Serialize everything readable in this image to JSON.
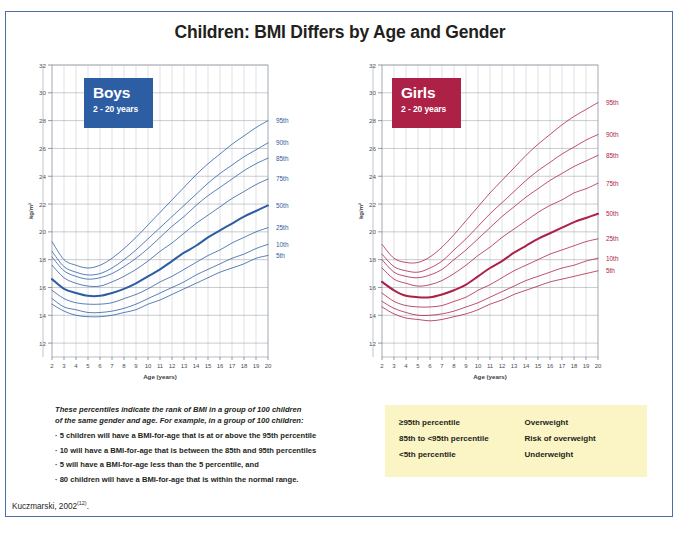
{
  "title": "Children: BMI Differs by Age and Gender",
  "citation": {
    "text": "Kuczmarski, 2002",
    "ref": "(12)",
    "suffix": "."
  },
  "colors": {
    "boys": "#2d5da3",
    "girls": "#ad2147",
    "frame": "#4a6fa8",
    "legend_bg": "#fbf4c4"
  },
  "panels": [
    {
      "key": "boys",
      "badge_name": "Boys",
      "badge_sub": "2 - 20 years",
      "color": "#2d5da3",
      "label_side": "right"
    },
    {
      "key": "girls",
      "badge_name": "Girls",
      "badge_sub": "2 - 20 years",
      "color": "#ad2147",
      "label_side": "right"
    }
  ],
  "notes": {
    "intro_line1": "These percentiles indicate the rank of BMI in a group of 100 children",
    "intro_line2": "of the same gender and age.  For example, in a group of 100 children:",
    "bullets": [
      "· 5 children will have a BMI-for-age that is at or above the 95th percentile",
      "· 10 will have a BMI-for-age that is between the 85th and 95th percentiles",
      "· 5 will have a BMI-for-age less than the 5 percentile, and",
      "· 80 children will have a BMI-for-age that is within the normal range."
    ]
  },
  "legend": {
    "rows": [
      {
        "range": "≥95th percentile",
        "label": "Overweight"
      },
      {
        "range": "85th to <95th percentile",
        "label": "Risk of overweight"
      },
      {
        "range": "<5th percentile",
        "label": "Underweight"
      }
    ]
  },
  "chart_data": [
    {
      "type": "line",
      "title": "Boys",
      "subtitle": "2 - 20 years",
      "xlabel": "Age (years)",
      "ylabel": "kg/m²",
      "xlim": [
        2,
        20
      ],
      "ylim": [
        11,
        32
      ],
      "xticks": [
        2,
        3,
        4,
        5,
        6,
        7,
        8,
        9,
        10,
        11,
        12,
        13,
        14,
        15,
        16,
        17,
        18,
        19,
        20
      ],
      "yticks": [
        12,
        14,
        16,
        18,
        20,
        22,
        24,
        26,
        28,
        30,
        32
      ],
      "grid": true,
      "legend_position": "right-of-curve-ends",
      "color": "#2d5da3",
      "x": [
        2,
        3,
        4,
        5,
        6,
        7,
        8,
        9,
        10,
        11,
        12,
        13,
        14,
        15,
        16,
        17,
        18,
        19,
        20
      ],
      "series": [
        {
          "name": "95th",
          "values": [
            19.3,
            18.0,
            17.6,
            17.4,
            17.6,
            18.1,
            18.8,
            19.6,
            20.5,
            21.4,
            22.3,
            23.2,
            24.1,
            24.9,
            25.6,
            26.3,
            26.9,
            27.5,
            28.0
          ]
        },
        {
          "name": "90th",
          "values": [
            18.6,
            17.5,
            17.1,
            16.9,
            17.0,
            17.4,
            18.0,
            18.7,
            19.5,
            20.3,
            21.1,
            21.9,
            22.7,
            23.5,
            24.2,
            24.8,
            25.4,
            25.9,
            26.4
          ]
        },
        {
          "name": "85th",
          "values": [
            18.2,
            17.2,
            16.8,
            16.6,
            16.7,
            17.0,
            17.5,
            18.1,
            18.8,
            19.6,
            20.4,
            21.1,
            21.9,
            22.6,
            23.2,
            23.8,
            24.4,
            24.9,
            25.3
          ]
        },
        {
          "name": "75th",
          "values": [
            17.6,
            16.7,
            16.3,
            16.1,
            16.1,
            16.4,
            16.8,
            17.3,
            17.9,
            18.6,
            19.2,
            19.9,
            20.6,
            21.2,
            21.8,
            22.4,
            22.9,
            23.4,
            23.8
          ]
        },
        {
          "name": "50th",
          "values": [
            16.6,
            15.9,
            15.6,
            15.4,
            15.4,
            15.6,
            15.9,
            16.3,
            16.8,
            17.3,
            17.9,
            18.5,
            19.0,
            19.6,
            20.1,
            20.6,
            21.1,
            21.5,
            21.9
          ]
        },
        {
          "name": "25th",
          "values": [
            15.8,
            15.2,
            14.9,
            14.8,
            14.8,
            14.9,
            15.2,
            15.5,
            15.9,
            16.4,
            16.8,
            17.3,
            17.8,
            18.3,
            18.7,
            19.2,
            19.6,
            20.0,
            20.3
          ]
        },
        {
          "name": "10th",
          "values": [
            15.2,
            14.6,
            14.4,
            14.2,
            14.2,
            14.3,
            14.5,
            14.8,
            15.2,
            15.6,
            16.0,
            16.4,
            16.9,
            17.3,
            17.7,
            18.1,
            18.4,
            18.8,
            19.1
          ]
        },
        {
          "name": "5th",
          "values": [
            14.8,
            14.3,
            14.0,
            13.9,
            13.9,
            14.0,
            14.2,
            14.4,
            14.8,
            15.1,
            15.5,
            15.9,
            16.3,
            16.7,
            17.1,
            17.4,
            17.7,
            18.1,
            18.3
          ]
        }
      ]
    },
    {
      "type": "line",
      "title": "Girls",
      "subtitle": "2 - 20 years",
      "xlabel": "Age (years)",
      "ylabel": "kg/m²",
      "xlim": [
        2,
        20
      ],
      "ylim": [
        11,
        32
      ],
      "xticks": [
        2,
        3,
        4,
        5,
        6,
        7,
        8,
        9,
        10,
        11,
        12,
        13,
        14,
        15,
        16,
        17,
        18,
        19,
        20
      ],
      "yticks": [
        12,
        14,
        16,
        18,
        20,
        22,
        24,
        26,
        28,
        30,
        32
      ],
      "grid": true,
      "legend_position": "right-of-curve-ends",
      "color": "#ad2147",
      "x": [
        2,
        3,
        4,
        5,
        6,
        7,
        8,
        9,
        10,
        11,
        12,
        13,
        14,
        15,
        16,
        17,
        18,
        19,
        20
      ],
      "series": [
        {
          "name": "95th",
          "values": [
            19.1,
            18.1,
            17.8,
            17.8,
            18.2,
            18.9,
            19.8,
            20.8,
            21.8,
            22.8,
            23.7,
            24.6,
            25.5,
            26.3,
            27.0,
            27.7,
            28.3,
            28.8,
            29.3
          ]
        },
        {
          "name": "90th",
          "values": [
            18.4,
            17.5,
            17.2,
            17.1,
            17.4,
            17.9,
            18.7,
            19.5,
            20.4,
            21.3,
            22.1,
            22.9,
            23.7,
            24.4,
            25.0,
            25.6,
            26.1,
            26.6,
            27.0
          ]
        },
        {
          "name": "85th",
          "values": [
            18.0,
            17.1,
            16.8,
            16.7,
            16.9,
            17.3,
            18.0,
            18.7,
            19.5,
            20.3,
            21.1,
            21.8,
            22.5,
            23.1,
            23.7,
            24.2,
            24.7,
            25.1,
            25.5
          ]
        },
        {
          "name": "75th",
          "values": [
            17.4,
            16.6,
            16.3,
            16.1,
            16.2,
            16.5,
            17.0,
            17.6,
            18.3,
            18.9,
            19.6,
            20.2,
            20.8,
            21.4,
            21.9,
            22.3,
            22.8,
            23.1,
            23.5
          ]
        },
        {
          "name": "50th",
          "values": [
            16.4,
            15.8,
            15.4,
            15.3,
            15.3,
            15.5,
            15.8,
            16.2,
            16.8,
            17.4,
            17.9,
            18.5,
            19.0,
            19.5,
            19.9,
            20.3,
            20.7,
            21.0,
            21.3
          ]
        },
        {
          "name": "25th",
          "values": [
            15.6,
            15.0,
            14.7,
            14.6,
            14.6,
            14.7,
            15.0,
            15.3,
            15.8,
            16.2,
            16.7,
            17.2,
            17.6,
            18.0,
            18.4,
            18.7,
            19.0,
            19.3,
            19.5
          ]
        },
        {
          "name": "10th",
          "values": [
            15.0,
            14.5,
            14.2,
            14.0,
            14.0,
            14.1,
            14.3,
            14.6,
            14.9,
            15.3,
            15.7,
            16.1,
            16.5,
            16.8,
            17.1,
            17.4,
            17.6,
            17.9,
            18.1
          ]
        },
        {
          "name": "5th",
          "values": [
            14.6,
            14.1,
            13.8,
            13.7,
            13.6,
            13.7,
            13.9,
            14.1,
            14.4,
            14.8,
            15.1,
            15.5,
            15.8,
            16.1,
            16.4,
            16.6,
            16.8,
            17.0,
            17.2
          ]
        }
      ]
    }
  ]
}
